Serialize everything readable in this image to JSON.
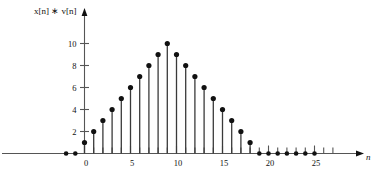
{
  "figure": {
    "title": "",
    "y_axis_label": "x[n] ∗ v[n]",
    "x_axis_label": "n"
  },
  "chart_data": {
    "type": "scatter",
    "plot_style": "stem",
    "title": "",
    "subtitle": "",
    "xlabel": "n",
    "ylabel": "x[n] ∗ v[n]",
    "xlim": [
      -3,
      28
    ],
    "ylim": [
      0,
      11
    ],
    "grid": false,
    "legend": null,
    "xticks": [
      0,
      5,
      10,
      15,
      20,
      25
    ],
    "xticklabels": [
      "0",
      "5",
      "10",
      "15",
      "20",
      "25"
    ],
    "yticks": [
      2,
      4,
      6,
      8,
      10
    ],
    "yticklabels": [
      "2",
      "4",
      "6",
      "8",
      "10"
    ],
    "minor_xticks_every": 1,
    "x": [
      -2,
      -1,
      0,
      1,
      2,
      3,
      4,
      5,
      6,
      7,
      8,
      9,
      10,
      11,
      12,
      13,
      14,
      15,
      16,
      17,
      18,
      19,
      20,
      21,
      22,
      23,
      24,
      25
    ],
    "values": [
      0,
      0,
      1,
      2,
      3,
      4,
      5,
      6,
      7,
      8,
      9,
      10,
      9,
      8,
      7,
      6,
      5,
      4,
      3,
      2,
      1,
      0,
      0,
      0,
      0,
      0,
      0,
      0
    ],
    "marker": "filled-circle",
    "marker_color": "#111111",
    "stem_color": "#3a3a3a",
    "axis_color": "#555555"
  }
}
